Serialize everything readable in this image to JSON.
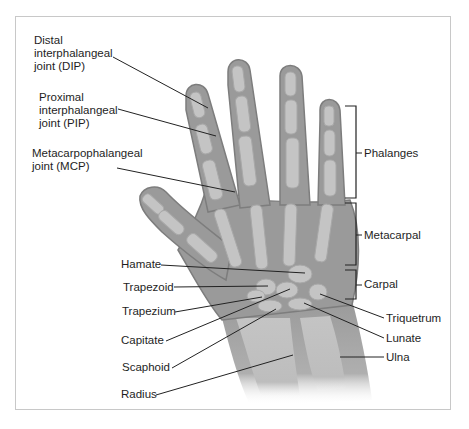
{
  "diagram": {
    "colors": {
      "frame": "#c8c8c8",
      "skin": "#9a9a9a",
      "skin_edge": "#7d7d7d",
      "bone": "#c2c2c2",
      "leader": "#222222",
      "text": "#1e1e1e"
    },
    "joint_labels": {
      "dip": "Distal\ninterphalangeal\njoint (DIP)",
      "pip": "Proximal\ninterphalangeal\njoint (PIP)",
      "mcp": "Metacarpophalangeal\njoint (MCP)"
    },
    "group_labels": {
      "phalanges": "Phalanges",
      "metacarpal": "Metacarpal",
      "carpal": "Carpal"
    },
    "left_bone_labels": {
      "hamate": "Hamate",
      "trapezoid": "Trapezoid",
      "trapezium": "Trapezium",
      "capitate": "Capitate",
      "scaphoid": "Scaphoid",
      "radius": "Radius"
    },
    "right_bone_labels": {
      "triquetrum": "Triquetrum",
      "lunate": "Lunate",
      "ulna": "Ulna"
    }
  }
}
